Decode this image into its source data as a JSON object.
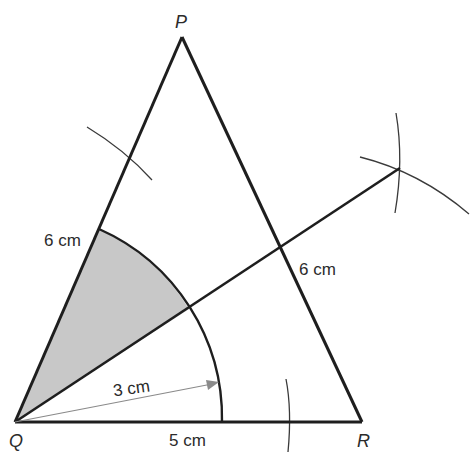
{
  "diagram": {
    "colors": {
      "stroke": "#1e1e1e",
      "construction": "#3a3a3a",
      "shade": "#c8c8c8",
      "radius_arrow": "#8a8a8a",
      "text": "#2b2b2b"
    },
    "vertices": {
      "P": {
        "label": "P",
        "x": 182,
        "y": 37
      },
      "Q": {
        "label": "Q",
        "x": 15,
        "y": 422
      },
      "R": {
        "label": "R",
        "x": 362,
        "y": 422
      }
    },
    "side_labels": {
      "QP": "6 cm",
      "PR": "6 cm",
      "QR": "5 cm"
    },
    "radius_label": "3 cm",
    "bisector_end": {
      "x": 400,
      "y": 168
    },
    "sector": {
      "center": "Q",
      "radius_px": 207,
      "label": "3 cm"
    }
  }
}
